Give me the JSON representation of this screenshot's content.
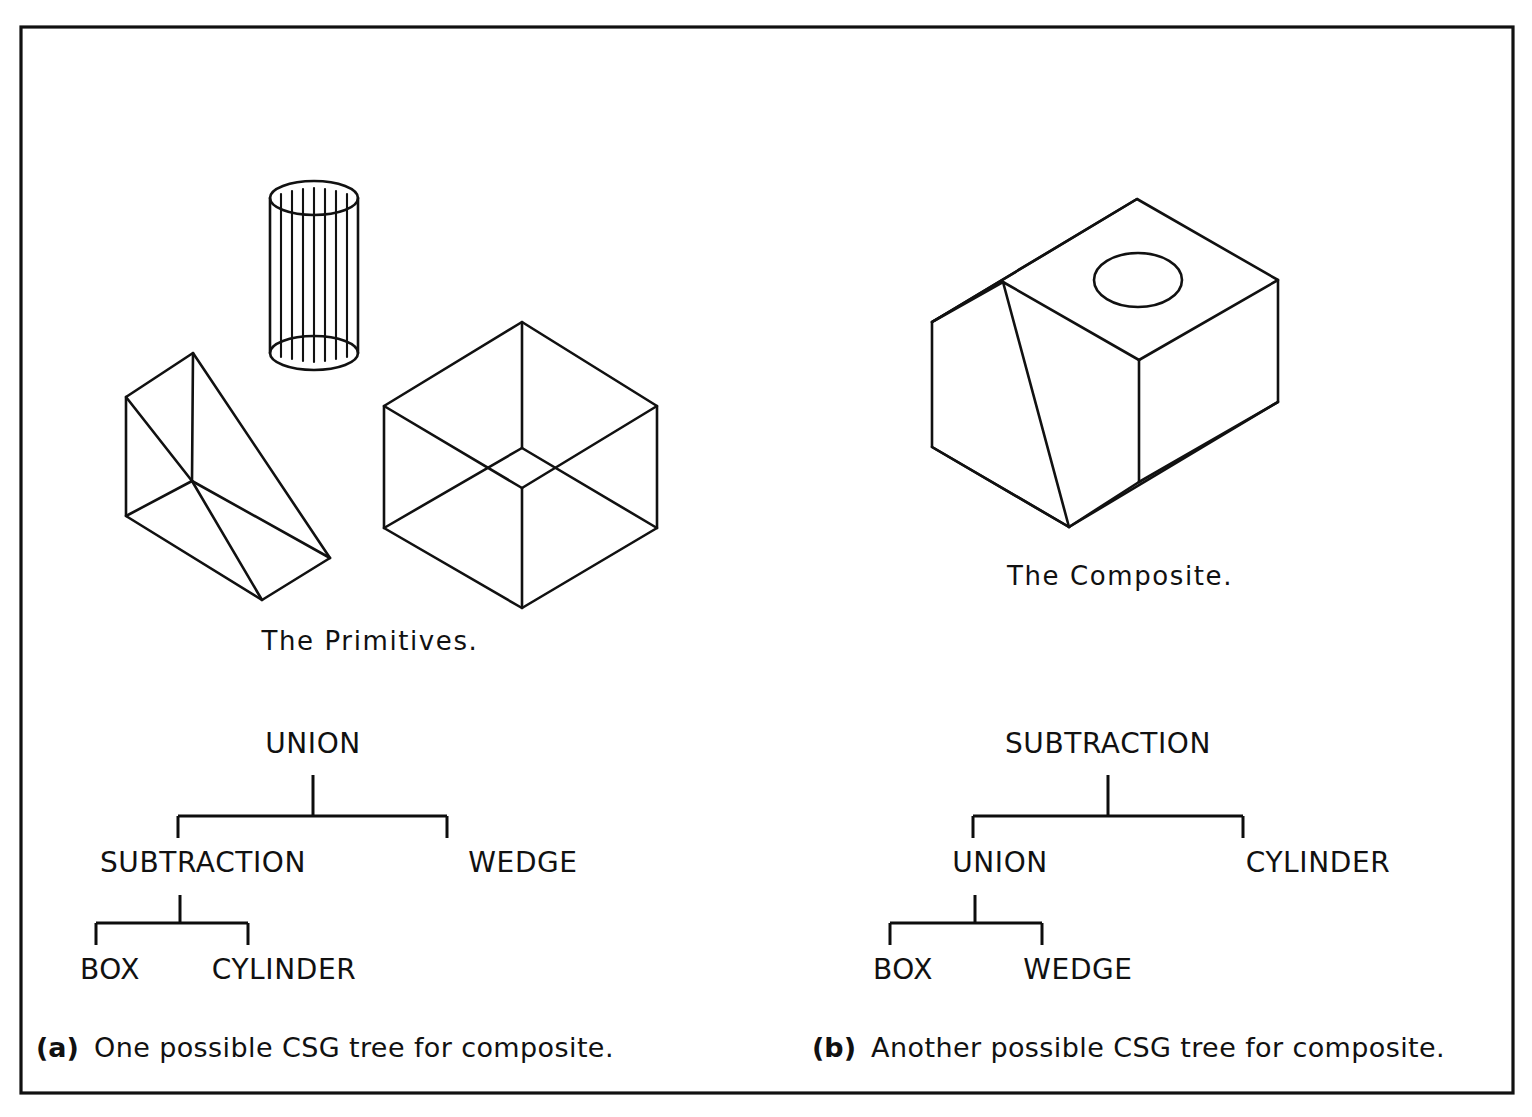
{
  "figure": {
    "title_alt": "CSG (Constructive Solid Geometry) tree figure",
    "border_color": "#111111",
    "ink_color": "#111111",
    "background": "#ffffff"
  },
  "panels": {
    "left": {
      "shape_label": "The Primitives.",
      "caption_tag": "(a)",
      "caption_text": "One possible CSG tree for composite.",
      "tree": {
        "root": "UNION",
        "level2_left": "SUBTRACTION",
        "level2_right": "WEDGE",
        "level3_left": "BOX",
        "level3_right": "CYLINDER"
      }
    },
    "right": {
      "shape_label": "The Composite.",
      "caption_tag": "(b)",
      "caption_text": "Another possible CSG tree for composite.",
      "tree": {
        "root": "SUBTRACTION",
        "level2_left": "UNION",
        "level2_right": "CYLINDER",
        "level3_left": "BOX",
        "level3_right": "WEDGE"
      }
    }
  },
  "shapes": {
    "wedge_name": "wedge-primitive",
    "cylinder_name": "cylinder-primitive",
    "box_name": "box-primitive",
    "composite_name": "composite-solid",
    "cylinder_rib_count": 7
  }
}
